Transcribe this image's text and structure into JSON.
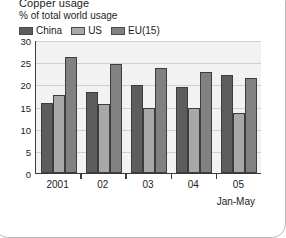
{
  "chart_data": {
    "type": "bar",
    "title": "Copper usage",
    "subtitle": "% of total world usage",
    "xlabel": "",
    "ylabel": "",
    "note": "Jan-May",
    "grid": true,
    "legend_position": "top-left",
    "ylim": [
      0,
      30
    ],
    "yticks": [
      0,
      5,
      10,
      15,
      20,
      25,
      30
    ],
    "ytick_labels": [
      "0",
      "5",
      "10",
      "15",
      "20",
      "25",
      "30"
    ],
    "categories": [
      "2001",
      "02",
      "03",
      "04",
      "05"
    ],
    "series": [
      {
        "name": "China",
        "color": "#5d5d5d",
        "values": [
          15.7,
          18.3,
          19.9,
          19.4,
          22.2
        ]
      },
      {
        "name": "US",
        "color": "#a8a8a8",
        "values": [
          17.5,
          15.5,
          14.7,
          14.6,
          13.5
        ]
      },
      {
        "name": "EU(15)",
        "color": "#818181",
        "values": [
          26.1,
          24.5,
          23.6,
          22.8,
          21.4
        ]
      }
    ]
  }
}
